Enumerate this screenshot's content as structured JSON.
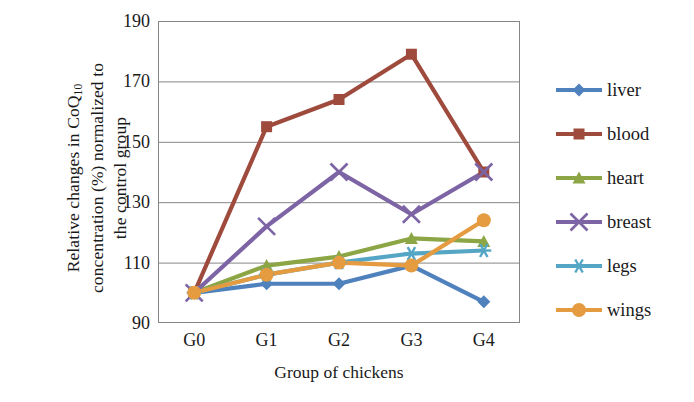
{
  "chart_data": {
    "type": "line",
    "title": "",
    "xlabel": "Group of chickens",
    "ylabel_line1": "Relative changes in CoQ",
    "ylabel_sub": "10",
    "ylabel_line2": "concentration (%) normalized to",
    "ylabel_line3": "the control group",
    "categories": [
      "G0",
      "G1",
      "G2",
      "G3",
      "G4"
    ],
    "yticks": [
      90,
      110,
      130,
      150,
      170,
      190
    ],
    "ylim": [
      90,
      190
    ],
    "grid": "horizontal",
    "legend_position": "right",
    "series": [
      {
        "name": "liver",
        "color": "#4F81BD",
        "marker": "diamond",
        "values": [
          100,
          103,
          103,
          109,
          97
        ]
      },
      {
        "name": "blood",
        "color": "#9E4A3C",
        "marker": "square",
        "values": [
          100,
          155,
          164,
          179,
          140
        ]
      },
      {
        "name": "heart",
        "color": "#8CA645",
        "marker": "triangle",
        "values": [
          100,
          109,
          112,
          118,
          117
        ]
      },
      {
        "name": "breast",
        "color": "#7D64A4",
        "marker": "cross",
        "values": [
          100,
          122,
          140,
          126,
          140
        ]
      },
      {
        "name": "legs",
        "color": "#54A6C4",
        "marker": "asterisk",
        "values": [
          100,
          106,
          110,
          113,
          114
        ]
      },
      {
        "name": "wings",
        "color": "#E59B3F",
        "marker": "circle",
        "values": [
          100,
          106,
          110,
          109,
          124
        ]
      }
    ]
  }
}
